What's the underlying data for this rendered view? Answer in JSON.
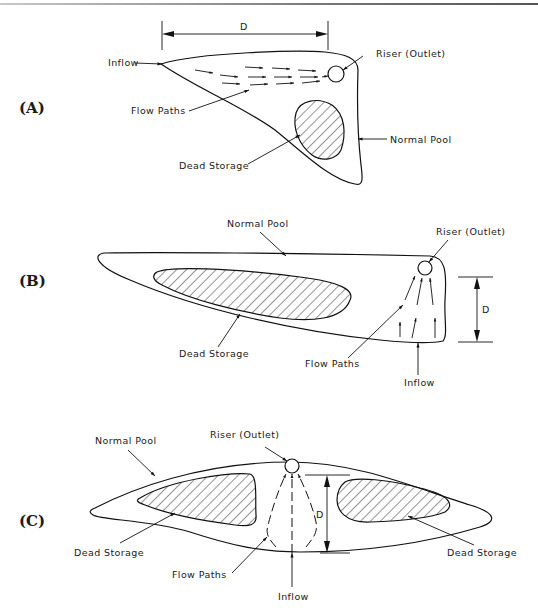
{
  "figure": {
    "panels": [
      {
        "id": "A",
        "label": "(A)",
        "labels": {
          "dimension": "D",
          "inflow": "Inflow",
          "riser": "Riser (Outlet)",
          "flow_paths": "Flow Paths",
          "normal_pool": "Normal Pool",
          "dead_storage": "Dead Storage"
        }
      },
      {
        "id": "B",
        "label": "(B)",
        "labels": {
          "normal_pool": "Normal Pool",
          "riser": "Riser (Outlet)",
          "dimension": "D",
          "dead_storage": "Dead Storage",
          "flow_paths": "Flow Paths",
          "inflow": "Inflow"
        }
      },
      {
        "id": "C",
        "label": "(C)",
        "labels": {
          "normal_pool": "Normal Pool",
          "riser": "Riser (Outlet)",
          "dimension": "D",
          "dead_storage_left": "Dead Storage",
          "dead_storage_right": "Dead Storage",
          "flow_paths": "Flow Paths",
          "inflow": "Inflow"
        }
      }
    ],
    "colors": {
      "ink": "#111111",
      "background": "#ffffff"
    }
  }
}
